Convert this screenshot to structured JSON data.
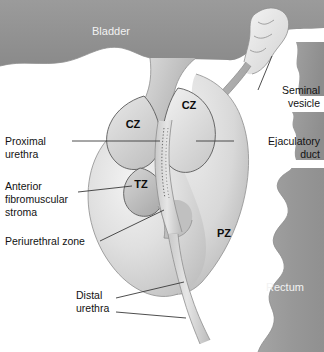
{
  "figure": {
    "width": 324,
    "height": 352
  },
  "labels": {
    "bladder": "Bladder",
    "rectum": "Rectum",
    "seminal_vesicle_line1": "Seminal",
    "seminal_vesicle_line2": "vesicle",
    "ejaculatory_duct_line1": "Ejaculatory",
    "ejaculatory_duct_line2": "duct",
    "proximal_urethra_line1": "Proximal",
    "proximal_urethra_line2": "urethra",
    "anterior_stroma_line1": "Anterior",
    "anterior_stroma_line2": "fibromuscular",
    "anterior_stroma_line3": "stroma",
    "periurethral_zone": "Periurethral zone",
    "distal_urethra_line1": "Distal",
    "distal_urethra_line2": "urethra"
  },
  "zones": {
    "cz_left": "CZ",
    "cz_right": "CZ",
    "tz": "TZ",
    "pz": "PZ"
  },
  "colors": {
    "background": "#ffffff",
    "bladder_fill": "#919191",
    "rectum_fill": "#9a9a9a",
    "rectum_dark": "#8b8b8b",
    "prostate_light": "#e2e2e2",
    "prostate_mid": "#cfcfcf",
    "prostate_dark": "#b5b5b5",
    "urethra": "#d6d6d6",
    "label_text": "#121212",
    "label_text_white": "#f2f2f2",
    "leader_line": "#3a3a3a",
    "outline": "#5a5a5a"
  }
}
